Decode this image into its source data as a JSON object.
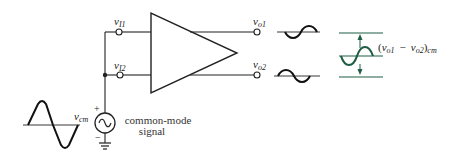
{
  "diagram": {
    "type": "circuit",
    "colors": {
      "wire": "#222222",
      "accent_green": "#1f5e44",
      "background": "#ffffff"
    },
    "inputs": [
      {
        "id": "vI1",
        "symbol": "v",
        "subscript": "I1"
      },
      {
        "id": "vI2",
        "symbol": "v",
        "subscript": "I2"
      }
    ],
    "outputs": [
      {
        "id": "vo1",
        "symbol": "v",
        "subscript": "o1"
      },
      {
        "id": "vo2",
        "symbol": "v",
        "subscript": "o2"
      }
    ],
    "source": {
      "symbol": "v",
      "subscript": "cm",
      "polarity_plus": "+",
      "polarity_minus": "−",
      "caption_line1": "common-mode",
      "caption_line2": "signal"
    },
    "difference_label": {
      "open": "(",
      "v1": "v",
      "sub1": "o1",
      "minus": "−",
      "v2": "v",
      "sub2": "o2",
      "close": ")",
      "suffix": "cm"
    }
  }
}
